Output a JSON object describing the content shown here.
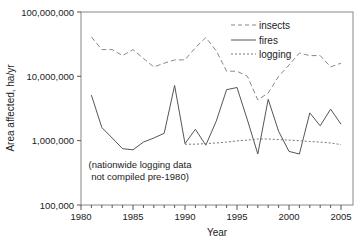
{
  "chart_data": {
    "type": "line",
    "title": "",
    "xlabel": "Year",
    "ylabel": "Area affected, ha/yr",
    "yscale": "log",
    "ylim": [
      100000,
      100000000
    ],
    "xlim": [
      1980,
      2006
    ],
    "x_ticks": [
      1980,
      1985,
      1990,
      1995,
      2000,
      2005
    ],
    "y_ticks": [
      100000,
      1000000,
      10000000,
      100000000
    ],
    "y_tick_labels": [
      "100,000",
      "1,000,000",
      "10,000,000",
      "100,000,000"
    ],
    "grid": false,
    "legend_position": "upper right",
    "annotation": [
      "(nationwide logging data",
      "not compiled pre-1980)"
    ],
    "series": [
      {
        "name": "insects",
        "style": "dashed",
        "x": [
          1981,
          1982,
          1983,
          1984,
          1985,
          1986,
          1987,
          1988,
          1989,
          1990,
          1991,
          1992,
          1993,
          1994,
          1995,
          1996,
          1997,
          1998,
          1999,
          2000,
          2001,
          2002,
          2003,
          2004,
          2005
        ],
        "values": [
          41000000,
          26000000,
          26000000,
          21000000,
          26000000,
          19000000,
          14000000,
          16000000,
          18000000,
          18000000,
          28000000,
          40000000,
          25000000,
          12000000,
          12000000,
          10000000,
          4300000,
          5500000,
          10000000,
          15000000,
          23000000,
          21000000,
          21000000,
          14000000,
          16000000
        ]
      },
      {
        "name": "fires",
        "style": "solid",
        "x": [
          1981,
          1982,
          1983,
          1984,
          1985,
          1986,
          1987,
          1988,
          1989,
          1990,
          1991,
          1992,
          1993,
          1994,
          1995,
          1996,
          1997,
          1998,
          1999,
          2000,
          2001,
          2002,
          2003,
          2004,
          2005
        ],
        "values": [
          5100000,
          1600000,
          1100000,
          750000,
          720000,
          950000,
          1100000,
          1300000,
          7200000,
          900000,
          1500000,
          850000,
          2000000,
          6200000,
          6700000,
          2100000,
          620000,
          4400000,
          1400000,
          680000,
          620000,
          2700000,
          1700000,
          3100000,
          1800000
        ]
      },
      {
        "name": "logging",
        "style": "dotted",
        "x": [
          1990,
          1991,
          1992,
          1993,
          1994,
          1995,
          1996,
          1997,
          1998,
          1999,
          2000,
          2001,
          2002,
          2003,
          2004,
          2005
        ],
        "values": [
          880000,
          880000,
          900000,
          920000,
          950000,
          990000,
          1020000,
          1060000,
          1060000,
          1040000,
          1020000,
          1000000,
          970000,
          950000,
          920000,
          870000
        ]
      }
    ]
  },
  "labels": {
    "y0": "100,000",
    "y1": "1,000,000",
    "y2": "10,000,000",
    "y3": "100,000,000",
    "x0": "1980",
    "x1": "1985",
    "x2": "1990",
    "x3": "1995",
    "x4": "2000",
    "x5": "2005",
    "xlabel": "Year",
    "ylabel": "Area affected, ha/yr",
    "legend": [
      "insects",
      "fires",
      "logging"
    ],
    "note1": "(nationwide logging data",
    "note2": "not compiled pre-1980)"
  }
}
